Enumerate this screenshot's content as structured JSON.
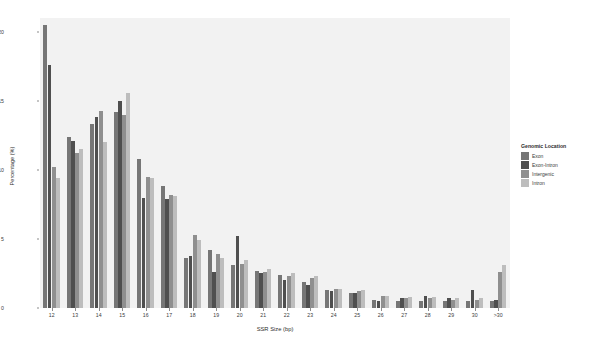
{
  "chart_data": {
    "type": "bar",
    "title": "",
    "xlabel": "SSR Size (bp)",
    "ylabel": "Percentage (%)",
    "ylim": [
      0,
      21
    ],
    "yticks": [
      0,
      5,
      10,
      15,
      20
    ],
    "ytick_labels": [
      "0",
      "5",
      "10",
      "15",
      "20"
    ],
    "grid": false,
    "legend_position": "right",
    "legend_title": "Genomic Location",
    "categories": [
      "12",
      "13",
      "14",
      "15",
      "16",
      "17",
      "18",
      "19",
      "20",
      "21",
      "22",
      "23",
      "24",
      "25",
      "26",
      "27",
      "28",
      "29",
      "30",
      ">30"
    ],
    "series": [
      {
        "name": "Exon",
        "color": "#767676",
        "values": [
          20.5,
          12.4,
          13.3,
          14.2,
          10.8,
          8.8,
          3.6,
          4.2,
          3.1,
          2.7,
          2.4,
          1.9,
          1.3,
          1.1,
          0.6,
          0.5,
          0.5,
          0.5,
          0.5,
          0.5
        ]
      },
      {
        "name": "Exon-Intron",
        "color": "#4f4f4f",
        "values": [
          17.6,
          12.1,
          13.8,
          15.0,
          8.0,
          7.9,
          3.8,
          2.6,
          5.2,
          2.5,
          2.0,
          1.7,
          1.2,
          1.1,
          0.5,
          0.7,
          0.9,
          0.7,
          1.3,
          0.6
        ]
      },
      {
        "name": "Intergenic",
        "color": "#8f8f8f",
        "values": [
          10.2,
          11.2,
          14.3,
          14.0,
          9.5,
          8.2,
          5.3,
          3.9,
          3.2,
          2.6,
          2.3,
          2.2,
          1.4,
          1.2,
          0.9,
          0.7,
          0.7,
          0.6,
          0.6,
          2.6
        ]
      },
      {
        "name": "Intron",
        "color": "#bdbdbd",
        "values": [
          9.4,
          11.5,
          12.0,
          15.6,
          9.4,
          8.1,
          4.9,
          3.6,
          3.5,
          2.8,
          2.5,
          2.3,
          1.4,
          1.3,
          0.9,
          0.8,
          0.8,
          0.7,
          0.7,
          3.1
        ]
      }
    ]
  },
  "axes": {
    "x_title": "SSR Size (bp)",
    "y_title": "Percentage (%)"
  },
  "legend": {
    "title": "Genomic Location",
    "items": [
      {
        "label": "Exon",
        "color": "#767676"
      },
      {
        "label": "Exon-Intron",
        "color": "#4f4f4f"
      },
      {
        "label": "Intergenic",
        "color": "#8f8f8f"
      },
      {
        "label": "Intron",
        "color": "#bdbdbd"
      }
    ]
  }
}
